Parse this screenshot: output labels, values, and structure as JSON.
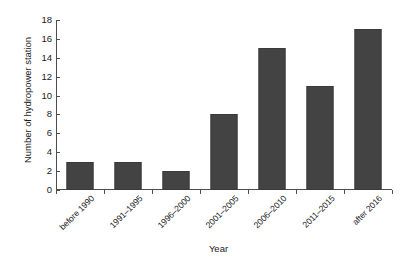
{
  "chart_data": {
    "type": "bar",
    "title": "",
    "xlabel": "Year",
    "ylabel": "Number of hydropower station",
    "categories": [
      "before 1990",
      "1991–1995",
      "1996–2000",
      "2001–2005",
      "2006–2010",
      "2011–2015",
      "after 2016"
    ],
    "values": [
      3,
      3,
      2,
      8,
      15,
      11,
      17
    ],
    "ylim": [
      0,
      18
    ],
    "ytick_step": 2,
    "yticks": [
      0,
      2,
      4,
      6,
      8,
      10,
      12,
      14,
      16,
      18
    ],
    "ytick_labels": [
      "0",
      "2",
      "4",
      "6",
      "8",
      "10",
      "12",
      "14",
      "16",
      "18"
    ],
    "grid": false,
    "legend": false,
    "legend_position": "none",
    "bar_color": "#434343",
    "bar_edge_color": "#3a3a3a",
    "axis_color": "#4d4d4d",
    "background_color": "#ffffff",
    "xtick_label_rotation": 45,
    "series": [
      {
        "name": "Number of hydropower station",
        "values": [
          3,
          3,
          2,
          8,
          15,
          11,
          17
        ]
      }
    ]
  }
}
